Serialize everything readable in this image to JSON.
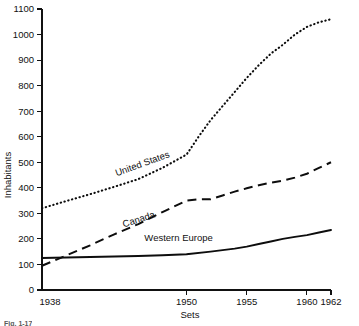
{
  "chart_data": {
    "type": "line",
    "title": "",
    "xlabel": "Sets",
    "ylabel": "Inhabitants",
    "xlim": [
      1938,
      1962
    ],
    "ylim": [
      0,
      1100
    ],
    "grid": false,
    "legend_position": "inline-labels",
    "x_ticks": [
      1938,
      1950,
      1955,
      1960,
      1962
    ],
    "x_tick_labels": [
      "1938",
      "1950",
      "1955",
      "1960",
      "1962"
    ],
    "y_ticks": [
      0,
      100,
      200,
      300,
      400,
      500,
      600,
      700,
      800,
      900,
      1000,
      1100
    ],
    "y_tick_labels": [
      "0",
      "100",
      "200",
      "300",
      "400",
      "500",
      "600",
      "700",
      "800",
      "900",
      "1000",
      "1100"
    ],
    "series": [
      {
        "name": "United States",
        "style": "dotted",
        "label_position": {
          "x": 1944.2,
          "y": 445,
          "rotation": -20
        },
        "x": [
          1938,
          1940,
          1942,
          1944,
          1946,
          1948,
          1950,
          1951,
          1952,
          1953,
          1954,
          1955,
          1956,
          1957,
          1958,
          1959,
          1960,
          1961,
          1962
        ],
        "values": [
          320,
          348,
          375,
          404,
          434,
          478,
          530,
          600,
          665,
          720,
          775,
          830,
          880,
          925,
          960,
          1000,
          1030,
          1048,
          1060
        ]
      },
      {
        "name": "Canada",
        "style": "dashed",
        "label_position": {
          "x": 1944.8,
          "y": 245,
          "rotation": -18
        },
        "x": [
          1938,
          1940,
          1942,
          1944,
          1946,
          1948,
          1950,
          1951,
          1952,
          1953,
          1954,
          1955,
          1956,
          1957,
          1958,
          1959,
          1960,
          1961,
          1962
        ],
        "values": [
          95,
          135,
          175,
          218,
          258,
          305,
          350,
          355,
          355,
          370,
          385,
          398,
          410,
          420,
          428,
          440,
          455,
          478,
          500
        ]
      },
      {
        "name": "Western Europe",
        "style": "solid",
        "label_position": {
          "x": 1946.5,
          "y": 193,
          "rotation": 0
        },
        "x": [
          1938,
          1940,
          1942,
          1944,
          1946,
          1948,
          1950,
          1952,
          1954,
          1955,
          1956,
          1957,
          1958,
          1959,
          1960,
          1961,
          1962
        ],
        "values": [
          125,
          127,
          129,
          131,
          133,
          136,
          140,
          150,
          162,
          170,
          180,
          190,
          200,
          208,
          215,
          225,
          235
        ]
      }
    ]
  },
  "caption": {
    "text": "Fig. 1-17"
  }
}
